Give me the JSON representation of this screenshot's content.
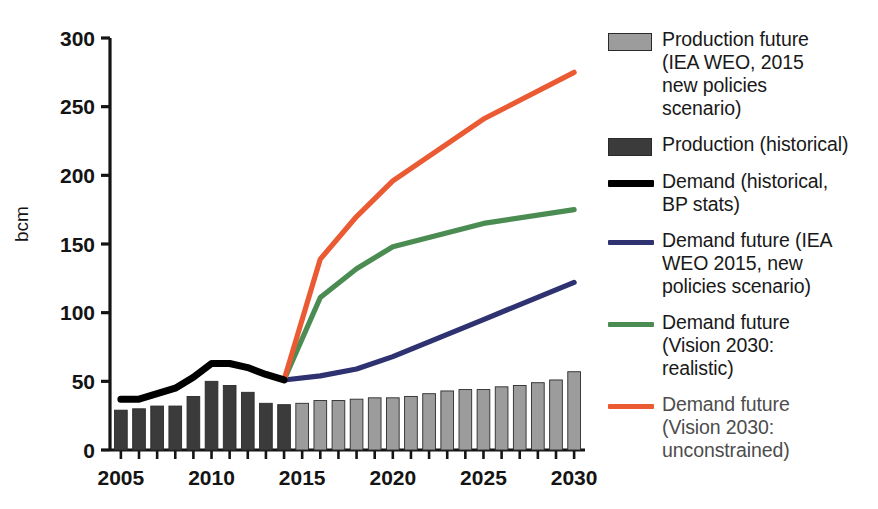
{
  "axes": {
    "y_label": "bcm",
    "y_ticks": [
      "0",
      "50",
      "100",
      "150",
      "200",
      "250",
      "300"
    ],
    "x_ticks_labeled": [
      "2005",
      "2010",
      "2015",
      "2020",
      "2025",
      "2030"
    ]
  },
  "colors": {
    "production_historical": "#3b3b3b",
    "production_future": "#9c9c9c",
    "demand_historical": "#000000",
    "demand_iea": "#2e3270",
    "demand_vision_realistic": "#4a8c52",
    "demand_vision_unconstrained": "#ea5b33",
    "axis": "#141414"
  },
  "legend": {
    "items": [
      {
        "name": "production-future",
        "marker": "bar-swatch",
        "color": "#9c9c9c",
        "label": "Production future (IEA WEO, 2015 new policies scenario)",
        "lines": [
          "Production future",
          "(IEA WEO, 2015",
          "new policies",
          "scenario)"
        ]
      },
      {
        "name": "production-historical",
        "marker": "bar-swatch",
        "color": "#3b3b3b",
        "label": "Production (historical)",
        "lines": [
          "Production (historical)"
        ]
      },
      {
        "name": "demand-historical",
        "marker": "line-swatch-thick",
        "color": "#000000",
        "label": "Demand (historical, BP stats)",
        "lines": [
          "Demand (historical,",
          "BP stats)"
        ]
      },
      {
        "name": "demand-future-iea",
        "marker": "line-swatch",
        "color": "#2e3270",
        "label": "Demand future (IEA WEO 2015, new policies scenario)",
        "lines": [
          "Demand future (IEA",
          "WEO 2015, new",
          "policies scenario)"
        ]
      },
      {
        "name": "demand-future-vision-realistic",
        "marker": "line-swatch",
        "color": "#4a8c52",
        "label": "Demand future (Vision 2030: realistic)",
        "lines": [
          "Demand future",
          "(Vision 2030:",
          "realistic)"
        ]
      },
      {
        "name": "demand-future-vision-unconstrained",
        "marker": "line-swatch",
        "color": "#ea5b33",
        "label": "Demand future (Vision 2030: unconstrained)",
        "lines": [
          "Demand future",
          "(Vision 2030:",
          "unconstrained)"
        ]
      }
    ]
  },
  "chart_data": {
    "type": "bar",
    "title": "",
    "xlabel": "",
    "ylabel": "bcm",
    "ylim": [
      0,
      300
    ],
    "xlim": [
      2004.4,
      2030.6
    ],
    "grid": false,
    "legend_position": "right",
    "categories": [
      2005,
      2006,
      2007,
      2008,
      2009,
      2010,
      2011,
      2012,
      2013,
      2014,
      2015,
      2016,
      2017,
      2018,
      2019,
      2020,
      2021,
      2022,
      2023,
      2024,
      2025,
      2026,
      2027,
      2028,
      2029,
      2030
    ],
    "series": [
      {
        "name": "Production (historical)",
        "type": "bar",
        "color": "#3b3b3b",
        "x": [
          2005,
          2006,
          2007,
          2008,
          2009,
          2010,
          2011,
          2012,
          2013,
          2014
        ],
        "values": [
          29,
          30,
          32,
          32,
          39,
          50,
          47,
          42,
          34,
          33
        ]
      },
      {
        "name": "Production future (IEA WEO, 2015 new policies scenario)",
        "type": "bar",
        "color": "#9c9c9c",
        "x": [
          2015,
          2016,
          2017,
          2018,
          2019,
          2020,
          2021,
          2022,
          2023,
          2024,
          2025,
          2026,
          2027,
          2028,
          2029,
          2030
        ],
        "values": [
          34,
          36,
          36,
          37,
          38,
          38,
          39,
          41,
          43,
          44,
          44,
          46,
          47,
          49,
          51,
          57
        ]
      },
      {
        "name": "Demand (historical, BP stats)",
        "type": "line",
        "color": "#000000",
        "x": [
          2005,
          2006,
          2007,
          2008,
          2009,
          2010,
          2011,
          2012,
          2013,
          2014
        ],
        "values": [
          37,
          37,
          41,
          45,
          53,
          63,
          63,
          60,
          55,
          51
        ]
      },
      {
        "name": "Demand future (IEA WEO 2015, new policies scenario)",
        "type": "line",
        "color": "#2e3270",
        "x": [
          2014,
          2016,
          2018,
          2020,
          2025,
          2030
        ],
        "values": [
          51,
          54,
          59,
          68,
          95,
          122
        ]
      },
      {
        "name": "Demand future (Vision 2030: realistic)",
        "type": "line",
        "color": "#4a8c52",
        "x": [
          2014,
          2016,
          2018,
          2020,
          2025,
          2030
        ],
        "values": [
          51,
          111,
          132,
          148,
          165,
          175
        ]
      },
      {
        "name": "Demand future (Vision 2030: unconstrained)",
        "type": "line",
        "color": "#ea5b33",
        "x": [
          2014,
          2016,
          2018,
          2020,
          2025,
          2030
        ],
        "values": [
          51,
          139,
          170,
          196,
          241,
          275
        ]
      }
    ]
  }
}
